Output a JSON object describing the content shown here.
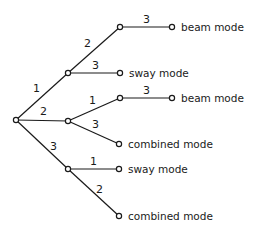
{
  "diagram": {
    "type": "tree",
    "nodes": [
      {
        "id": "root",
        "x": 16,
        "y": 120
      },
      {
        "id": "n1",
        "x": 68,
        "y": 73
      },
      {
        "id": "n2",
        "x": 68,
        "y": 121
      },
      {
        "id": "n3",
        "x": 68,
        "y": 169
      },
      {
        "id": "n1a",
        "x": 120,
        "y": 27
      },
      {
        "id": "leaf1",
        "x": 172,
        "y": 27,
        "label": "beam mode"
      },
      {
        "id": "leaf2",
        "x": 120,
        "y": 73,
        "label": "sway mode"
      },
      {
        "id": "n2a",
        "x": 120,
        "y": 98
      },
      {
        "id": "leaf3",
        "x": 172,
        "y": 98,
        "label": "beam mode"
      },
      {
        "id": "leaf4",
        "x": 119,
        "y": 144,
        "label": "combined mode"
      },
      {
        "id": "leaf5",
        "x": 119,
        "y": 169,
        "label": "sway mode"
      },
      {
        "id": "leaf6",
        "x": 119,
        "y": 216,
        "label": "combined mode"
      }
    ],
    "edges": [
      {
        "from": "root",
        "to": "n1",
        "label": "1"
      },
      {
        "from": "root",
        "to": "n2",
        "label": "2"
      },
      {
        "from": "root",
        "to": "n3",
        "label": "3"
      },
      {
        "from": "n1",
        "to": "n1a",
        "label": "2"
      },
      {
        "from": "n1a",
        "to": "leaf1",
        "label": "3"
      },
      {
        "from": "n1",
        "to": "leaf2",
        "label": "3"
      },
      {
        "from": "n2",
        "to": "n2a",
        "label": "1"
      },
      {
        "from": "n2a",
        "to": "leaf3",
        "label": "3"
      },
      {
        "from": "n2",
        "to": "leaf4",
        "label": "3"
      },
      {
        "from": "n3",
        "to": "leaf5",
        "label": "1"
      },
      {
        "from": "n3",
        "to": "leaf6",
        "label": "2"
      }
    ]
  },
  "labels": {
    "e_root_n1": "1",
    "e_root_n2": "2",
    "e_root_n3": "3",
    "e_n1_n1a": "2",
    "e_n1a_leaf1": "3",
    "e_n1_leaf2": "3",
    "e_n2_n2a": "1",
    "e_n2a_leaf3": "3",
    "e_n2_leaf4": "3",
    "e_n3_leaf5": "1",
    "e_n3_leaf6": "2",
    "leaf1": "beam mode",
    "leaf2": "sway mode",
    "leaf3": "beam mode",
    "leaf4": "combined mode",
    "leaf5": "sway mode",
    "leaf6": "combined mode"
  }
}
